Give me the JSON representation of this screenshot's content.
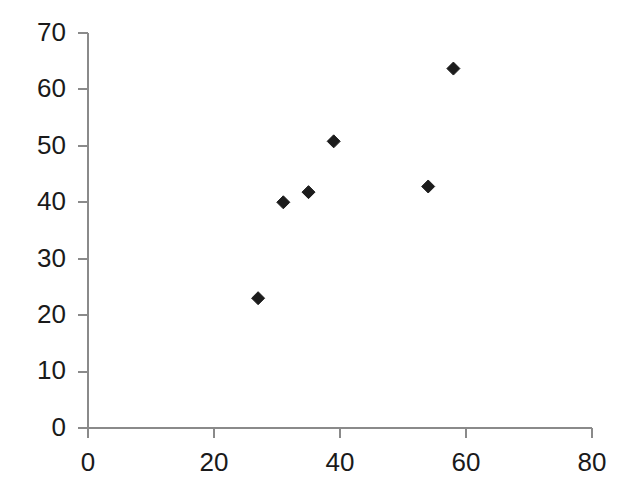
{
  "chart_data": {
    "type": "scatter",
    "title": "",
    "subtitle": "",
    "xlabel": "",
    "ylabel": "",
    "xlim": [
      0,
      80
    ],
    "ylim": [
      0,
      70
    ],
    "xticks": [
      0,
      20,
      40,
      60,
      80
    ],
    "yticks": [
      0,
      10,
      20,
      30,
      40,
      50,
      60,
      70
    ],
    "xtick_labels": [
      "0",
      "20",
      "40",
      "60",
      "80"
    ],
    "ytick_labels": [
      "0",
      "10",
      "20",
      "30",
      "40",
      "50",
      "60",
      "70"
    ],
    "grid": false,
    "legend": null,
    "legend_position": "none",
    "marker": {
      "shape": "diamond",
      "color": "#1c1c1c",
      "size": 13
    },
    "series": [
      {
        "name": "series-1",
        "points": [
          {
            "x": 27,
            "y": 23
          },
          {
            "x": 31,
            "y": 40
          },
          {
            "x": 35,
            "y": 41.8
          },
          {
            "x": 39,
            "y": 50.8
          },
          {
            "x": 54,
            "y": 42.8
          },
          {
            "x": 58,
            "y": 63.7
          }
        ]
      }
    ],
    "annotations": [],
    "colors": {
      "background": "#ffffff",
      "axis": "#8a8a8a",
      "text": "#1a1a1a",
      "marker": "#1c1c1c"
    }
  }
}
